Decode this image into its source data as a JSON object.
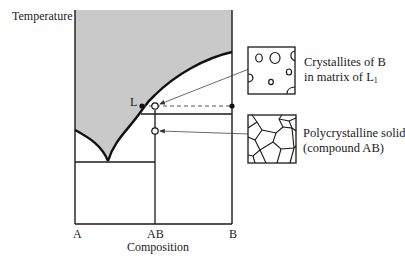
{
  "diagram": {
    "type": "binary phase diagram with congruently melting compound AB (peritectic-like region)",
    "y_axis_label": "Temperature",
    "x_axis_label": "Composition",
    "x_ticks": [
      "A",
      "AB",
      "B"
    ],
    "point_label": "L",
    "colors": {
      "liquid_region": "#c9c9c9",
      "lines": "#1a1a1a",
      "background": "#ffffff"
    },
    "callouts": [
      {
        "line1": "Crystallites of B",
        "line2_prefix": "in matrix of L",
        "line2_sub": "1",
        "microstructure": "round crystallites in matrix"
      },
      {
        "line1": "Polycrystalline solid",
        "line2": "(compound AB)",
        "microstructure": "polygonal grains"
      }
    ]
  }
}
